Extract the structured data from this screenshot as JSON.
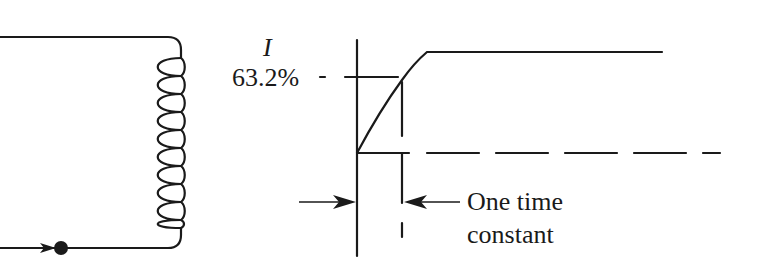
{
  "diagram": {
    "circuit": {
      "components": [
        "inductor-coil",
        "junction-dot",
        "current-arrow"
      ],
      "coil_turns": 10
    },
    "graph": {
      "y_axis_label": "I",
      "level_label": "63.2%",
      "annotation_line1": "One time",
      "annotation_line2": "constant"
    },
    "colors": {
      "stroke": "#1a1a1a",
      "background": "#ffffff"
    }
  }
}
